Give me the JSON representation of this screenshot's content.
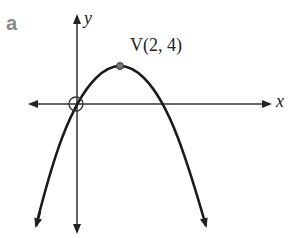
{
  "part_label": "a",
  "axes": {
    "x_label": "x",
    "y_label": "y"
  },
  "vertex": {
    "label": "V(2, 4)",
    "x": 2,
    "y": 4
  },
  "curve": {
    "type": "parabola",
    "equation": "y = -(x - 2)^2 + 4",
    "opens": "down",
    "roots": [
      0,
      4
    ],
    "highlighted_point": "origin (0, 0)"
  },
  "colors": {
    "axis": "#333333",
    "curve": "#1a1a1a",
    "part_label": "#8a8a8a",
    "vertex_dot": "#777777"
  }
}
